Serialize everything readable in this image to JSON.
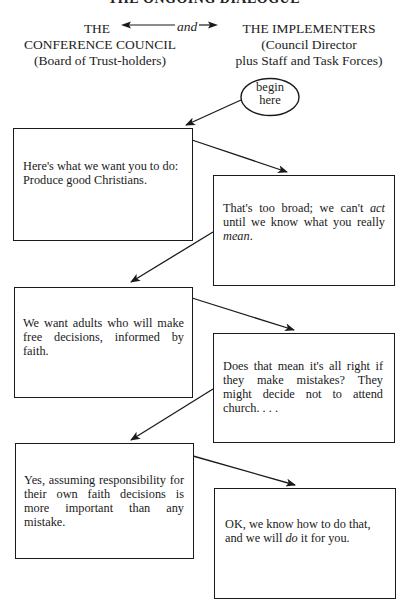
{
  "page": {
    "title_partial": "THE ONGOING DIALOGUE"
  },
  "header": {
    "left": {
      "line1": "THE",
      "line2": "CONFERENCE COUNCIL",
      "line3": "(Board of Trust-holders)"
    },
    "connector": "and",
    "right": {
      "line1": "THE IMPLEMENTERS",
      "line2": "(Council Director",
      "line3": "plus Staff and Task Forces)"
    }
  },
  "start": {
    "line1": "begin",
    "line2": "here"
  },
  "dialogue": [
    {
      "speaker": "council",
      "pre": "Here's what we want you to do: Produce good Christians.",
      "em": "",
      "post": ""
    },
    {
      "speaker": "implementers",
      "pre": "That's too broad; we can't ",
      "em": "act",
      "post": " until we know what you really ",
      "em2": "mean",
      "post2": "."
    },
    {
      "speaker": "council",
      "pre": "We want adults who will make free decisions, informed by faith.",
      "em": "",
      "post": ""
    },
    {
      "speaker": "implementers",
      "pre": "Does that mean it's all right if they make mistakes? They might decide not to attend church. . . .",
      "em": "",
      "post": ""
    },
    {
      "speaker": "council",
      "pre": "Yes, assuming responsibility for their own faith decisions is more important than any mistake.",
      "em": "",
      "post": ""
    },
    {
      "speaker": "implementers",
      "pre": "OK, we know how to do that, and we will ",
      "em": "do",
      "post": " it for you."
    }
  ],
  "colors": {
    "ink": "#1a1a1a",
    "paper": "#ffffff"
  }
}
